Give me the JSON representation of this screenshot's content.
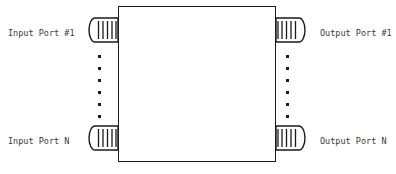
{
  "diagram": {
    "colors": {
      "stroke": "#1a1a1a",
      "text": "#3a3a3a",
      "background": "#ffffff"
    },
    "main_block": {
      "name": "device-body",
      "fill": "#ffffff"
    },
    "labels": {
      "input_first": "Input Port #1",
      "input_last": "Input Port N",
      "output_first": "Output Port #1",
      "output_last": "Output Port N"
    },
    "connectors": [
      {
        "id": "input-1",
        "side": "left",
        "position": "top",
        "stripes": 5
      },
      {
        "id": "input-n",
        "side": "left",
        "position": "bottom",
        "stripes": 5
      },
      {
        "id": "output-1",
        "side": "right",
        "position": "top",
        "stripes": 5
      },
      {
        "id": "output-n",
        "side": "right",
        "position": "bottom",
        "stripes": 5
      }
    ],
    "ellipsis": {
      "dot_count": 6,
      "meaning": "continuation of ports between first and N"
    }
  }
}
